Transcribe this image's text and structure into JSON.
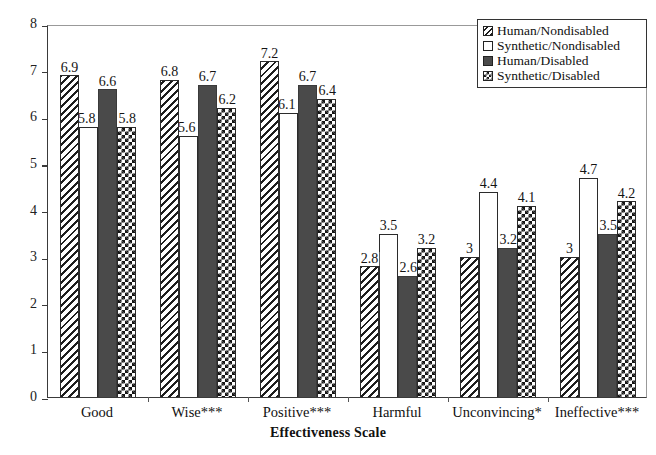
{
  "chart_data": {
    "type": "bar",
    "title": "",
    "xlabel": "Effectiveness Scale",
    "ylabel": "Rating",
    "ylim": [
      0,
      8
    ],
    "yticks": [
      0,
      1,
      2,
      3,
      4,
      5,
      6,
      7,
      8
    ],
    "grid": false,
    "legend_position": "top-right",
    "categories": [
      "Good",
      "Wise***",
      "Positive***",
      "Harmful",
      "Unconvincing*",
      "Ineffective***"
    ],
    "series": [
      {
        "name": "Human/Nondisabled",
        "pattern": "diagonal-hatch",
        "color": "#ffffff",
        "values": [
          6.9,
          6.8,
          7.2,
          2.8,
          3,
          3
        ],
        "labels": [
          "6.9",
          "6.8",
          "7.2",
          "2.8",
          "3",
          "3"
        ]
      },
      {
        "name": "Synthetic/Nondisabled",
        "pattern": "empty-white",
        "color": "#ffffff",
        "values": [
          5.8,
          5.6,
          6.1,
          3.5,
          4.4,
          4.7
        ],
        "labels": [
          "5.8",
          "5.6",
          "6.1",
          "3.5",
          "4.4",
          "4.7"
        ]
      },
      {
        "name": "Human/Disabled",
        "pattern": "solid-fill",
        "color": "#4a4a4a",
        "values": [
          6.6,
          6.7,
          6.7,
          2.6,
          3.2,
          3.5
        ],
        "labels": [
          "6.6",
          "6.7",
          "6.7",
          "2.6",
          "3.2",
          "3.5"
        ]
      },
      {
        "name": "Synthetic/Disabled",
        "pattern": "checkerboard",
        "color": "#141414",
        "values": [
          5.8,
          6.2,
          6.4,
          3.2,
          4.1,
          4.2
        ],
        "labels": [
          "5.8",
          "6.2",
          "6.4",
          "3.2",
          "4.1",
          "4.2"
        ]
      }
    ]
  },
  "axes": {
    "y_title": "Rating",
    "x_title": "Effectiveness Scale",
    "y_tick_labels": [
      "8",
      "7",
      "6",
      "5",
      "4",
      "3",
      "2",
      "1",
      "0"
    ],
    "x_tick_labels": [
      "Good",
      "Wise***",
      "Positive***",
      "Harmful",
      "Unconvincing*",
      "Ineffective***"
    ]
  },
  "legend": {
    "items": [
      {
        "label": "Human/Nondisabled",
        "style": "s-hatch"
      },
      {
        "label": "Synthetic/Nondisabled",
        "style": "s-white"
      },
      {
        "label": "Human/Disabled",
        "style": "s-solid"
      },
      {
        "label": "Synthetic/Disabled",
        "style": "s-check"
      }
    ]
  }
}
